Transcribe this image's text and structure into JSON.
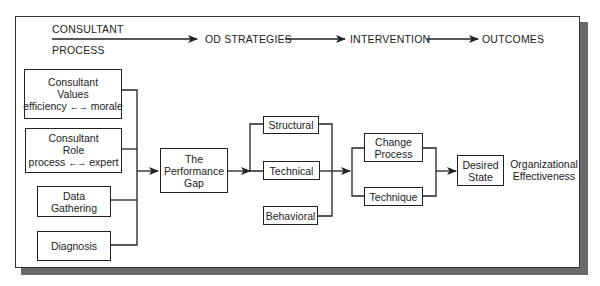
{
  "header": {
    "consultant": "CONSULTANT",
    "process": "PROCESS",
    "od_strategies": "OD STRATEGIES",
    "intervention": "INTERVENTION",
    "outcomes": "OUTCOMES"
  },
  "inputs": [
    {
      "line1": "Consultant",
      "line2": "Values",
      "line3_left": "efficiency",
      "line3_arrow": "←→",
      "line3_right": "morale"
    },
    {
      "line1": "Consultant",
      "line2": "Role",
      "line3_left": "process",
      "line3_arrow": "←→",
      "line3_right": "expert"
    },
    {
      "line1": "Data",
      "line2": "Gathering"
    },
    {
      "line1": "Diagnosis"
    }
  ],
  "gap": {
    "line1": "The",
    "line2": "Performance",
    "line3": "Gap"
  },
  "strategies": [
    "Structural",
    "Technical",
    "Behavioral"
  ],
  "interventions": [
    {
      "line1": "Change",
      "line2": "Process"
    },
    {
      "line1": "Technique"
    }
  ],
  "desired_state": {
    "line1": "Desired",
    "line2": "State"
  },
  "outcome_label": {
    "line1": "Organizational",
    "line2": "Effectiveness"
  },
  "colors": {
    "line": "#222222",
    "shadow": "#6a6a6a",
    "background": "#ffffff"
  }
}
